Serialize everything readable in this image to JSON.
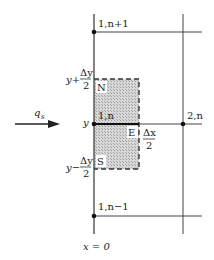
{
  "diagram": {
    "nodes": {
      "top": "1,n+1",
      "center": "1,n",
      "right": "2,n",
      "bottom": "1,n−1"
    },
    "faces": {
      "north": "N",
      "east": "E",
      "south": "S"
    },
    "y_labels": {
      "upper_num": "y+",
      "upper_frac_num": "Δy",
      "upper_frac_den": "2",
      "center": "y",
      "lower_num": "y−",
      "lower_frac_num": "Δy",
      "lower_frac_den": "2"
    },
    "east_half": {
      "num": "Δx",
      "den": "2"
    },
    "flux_label": "q",
    "flux_sub": "s",
    "boundary_label": "x = 0",
    "colors": {
      "line": "#222222",
      "shade": "#c8c8c8"
    }
  }
}
